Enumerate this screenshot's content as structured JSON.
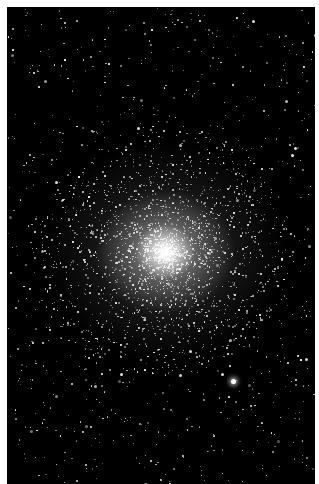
{
  "image": {
    "subject": "globular star cluster",
    "description": "Dense globular star cluster with bright central core on black sky background, surrounded by scattered field stars",
    "background_color": "#000000",
    "border_color": "#ffffff",
    "core_center": [
      158,
      245
    ],
    "core_color": "#ffffff",
    "bright_star": [
      226,
      374
    ]
  }
}
